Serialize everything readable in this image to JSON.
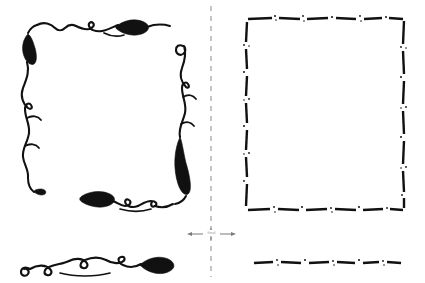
{
  "figure": {
    "background_color": "#ffffff",
    "ink_color": "#111111",
    "guide_color": "#8b8b8b",
    "width": 425,
    "height": 283
  },
  "divider": {
    "name": "vertical-dashed-divider",
    "x": 211,
    "y_start": 6,
    "y_end": 277,
    "dash_pattern": "5 5",
    "color": "#8b8b8b"
  },
  "transform_arrow": {
    "name": "bidirectional-transform-arrow",
    "label": "final",
    "y": 234,
    "x_left_tip": 187,
    "x_right_tip": 236,
    "direction": "both",
    "color": "#7a7a7a"
  },
  "left_panel": {
    "name": "ornate-flourish-frame",
    "caption": "Hand-drawn vine and leaf border",
    "style": "continuous ink stroke",
    "elements": [
      {
        "name": "top-left-corner-leaf",
        "type": "leaf-flourish"
      },
      {
        "name": "top-horizontal-vine",
        "type": "vine-flourish"
      },
      {
        "name": "left-vertical-vine",
        "type": "vine-flourish"
      },
      {
        "name": "right-vertical-vine",
        "type": "spiral-vine-flourish"
      },
      {
        "name": "bottom-horizontal-vine",
        "type": "leaf-vine-flourish"
      },
      {
        "name": "detached-bottom-flourish",
        "type": "spiral-leaf-flourish"
      }
    ]
  },
  "right_panel": {
    "name": "dashed-frame",
    "caption": "Dashed and stippled rectangle border",
    "style": "broken dashed stroke with speckles",
    "rect": {
      "x": 246,
      "y": 18,
      "width": 158,
      "height": 192
    },
    "elements": [
      {
        "name": "dashed-rectangle-top",
        "type": "dashed-line"
      },
      {
        "name": "dashed-rectangle-right",
        "type": "dashed-line"
      },
      {
        "name": "dashed-rectangle-bottom",
        "type": "dashed-line"
      },
      {
        "name": "dashed-rectangle-left",
        "type": "dashed-line"
      },
      {
        "name": "detached-dashed-rule",
        "type": "dashed-line"
      }
    ]
  }
}
